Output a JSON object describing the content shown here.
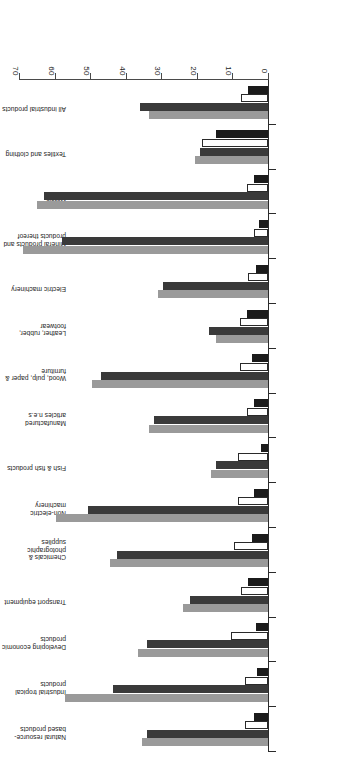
{
  "figure": {
    "orientation_note": "upside-down",
    "background_color": "#ffffff"
  },
  "axis": {
    "tick_labels": [
      "0",
      "10",
      "20",
      "30",
      "40",
      "50",
      "60",
      "70"
    ],
    "tick_values": [
      0,
      10,
      20,
      30,
      40,
      50,
      60,
      70
    ]
  },
  "series_colors": {
    "series1": "#1b1b1b",
    "series2": "#ffffff",
    "series3": "#3a3a3a",
    "series4": "#9a9a9a"
  },
  "chart_data": {
    "type": "bar",
    "orientation": "horizontal",
    "title": "",
    "subtitle": "",
    "xlabel": "",
    "ylabel": "",
    "xlim": [
      0,
      70
    ],
    "grid": false,
    "legend": "none",
    "categories": [
      "All industrial products",
      "Textiles and clothing",
      "Metals",
      "Mineral products and products thereof",
      "Electric machinery",
      "Leather, rubber, footwear",
      "Wood, pulp, paper & furniture",
      "Manufactured articles n.e.s",
      "Fish & fish products",
      "Non-electric machinery",
      "Chemicals & photographic supplies",
      "Transport equipment",
      "Developing economic products",
      "Industrial tropical products",
      "Natural resource-based products"
    ],
    "series": [
      {
        "name": "series1",
        "values": [
          5.5,
          14.5,
          4.0,
          2.5,
          3.5,
          6.0,
          4.5,
          4.0,
          2.0,
          4.0,
          4.5,
          5.5,
          3.5,
          3.0,
          4.0
        ]
      },
      {
        "name": "series2",
        "values": [
          7.5,
          18.5,
          6.0,
          4.0,
          5.5,
          8.0,
          8.0,
          6.0,
          8.5,
          8.5,
          9.5,
          7.5,
          10.5,
          6.5,
          6.5
        ]
      },
      {
        "name": "series3",
        "values": [
          36.0,
          19.0,
          63.0,
          58.0,
          29.5,
          16.5,
          47.0,
          32.0,
          14.5,
          50.5,
          42.5,
          22.0,
          34.0,
          43.5,
          34.0
        ]
      },
      {
        "name": "series4",
        "values": [
          33.5,
          20.5,
          65.0,
          69.0,
          31.0,
          14.5,
          49.5,
          33.5,
          16.0,
          59.5,
          44.5,
          24.0,
          36.5,
          57.0,
          35.5
        ]
      }
    ]
  }
}
